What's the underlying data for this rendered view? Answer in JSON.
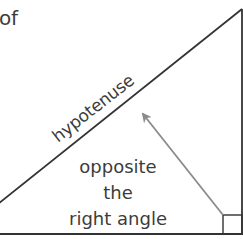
{
  "diagram": {
    "partial_heading": "of",
    "hypotenuse_label": "hypotenuse",
    "annotation_lines": [
      "opposite",
      "the",
      "right angle"
    ],
    "colors": {
      "line": "#333333",
      "arrow": "#8a8a8a",
      "text": "#3c3c3c",
      "background": "#ffffff"
    },
    "shapes": {
      "triangle": "right triangle with right angle at bottom-right",
      "right_angle_marker": "small square at bottom-right corner",
      "arrow": "grey arrow from right-angle corner pointing to hypotenuse"
    }
  }
}
